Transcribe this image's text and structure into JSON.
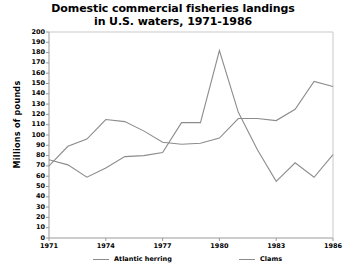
{
  "chart_data": {
    "type": "line",
    "title": "Domestic commercial fisheries landings in U.S. waters, 1971-1986",
    "title_lines": [
      "Domestic commercial fisheries landings",
      "in U.S. waters, 1971-1986"
    ],
    "xlabel": "",
    "ylabel": "Millions of pounds",
    "ylim": [
      0,
      200
    ],
    "ytick_step": 10,
    "yticks": [
      200,
      190,
      180,
      170,
      160,
      150,
      140,
      130,
      120,
      110,
      100,
      90,
      80,
      70,
      60,
      50,
      40,
      30,
      20,
      10,
      0
    ],
    "xlim": [
      1971,
      1986
    ],
    "xticks": [
      1971,
      1974,
      1977,
      1980,
      1983,
      1986
    ],
    "xtick_labels": [
      "1971",
      "1974",
      "1977",
      "1980",
      "1983",
      "1986"
    ],
    "x": [
      1971,
      1972,
      1973,
      1974,
      1975,
      1976,
      1977,
      1978,
      1979,
      1980,
      1981,
      1982,
      1983,
      1984,
      1985,
      1986
    ],
    "grid": false,
    "legend_position": "bottom",
    "line_color": "#8c8c8c",
    "series": [
      {
        "name": "Atlantic herring",
        "values": [
          76,
          71,
          59,
          68,
          79,
          80,
          83,
          112,
          112,
          182,
          122,
          86,
          55,
          73,
          59,
          81
        ]
      },
      {
        "name": "Clams",
        "values": [
          70,
          89,
          96,
          115,
          113,
          104,
          93,
          91,
          92,
          97,
          116,
          116,
          114,
          125,
          152,
          147
        ]
      }
    ]
  },
  "legend": {
    "entries": [
      {
        "label": "Atlantic herring"
      },
      {
        "label": "Clams"
      }
    ]
  },
  "colors": {
    "line": "#8c8c8c",
    "axis": "#9a9a9a",
    "text": "#000000",
    "background": "#ffffff"
  }
}
